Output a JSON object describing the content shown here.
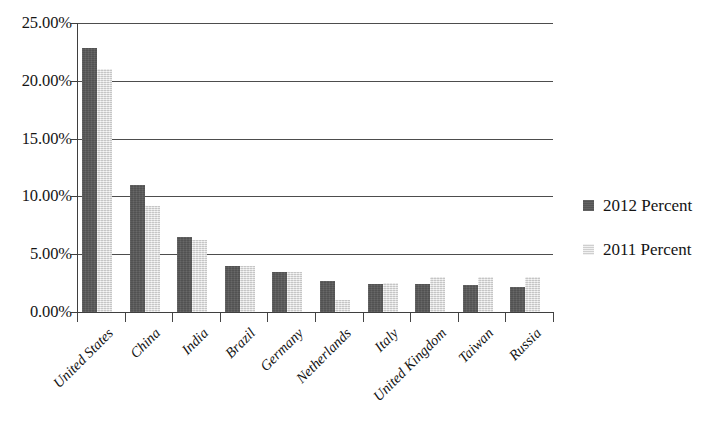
{
  "chart_data": {
    "type": "bar",
    "title": "",
    "subtitle": "",
    "xlabel": "",
    "ylabel": "",
    "ylim": [
      0,
      25
    ],
    "y_tick_labels": [
      "0.00%",
      "5.00%",
      "10.00%",
      "15.00%",
      "20.00%",
      "25.00%"
    ],
    "y_tick_values": [
      0,
      5,
      10,
      15,
      20,
      25
    ],
    "grid": true,
    "legend_position": "right",
    "categories": [
      "United States",
      "China",
      "India",
      "Brazil",
      "Germany",
      "Netherlands",
      "Italy",
      "United Kingdom",
      "Taiwan",
      "Russia"
    ],
    "series": [
      {
        "name": "2012 Percent",
        "color": "#595959",
        "values": [
          22.8,
          11.0,
          6.5,
          4.0,
          3.5,
          2.7,
          2.4,
          2.4,
          2.3,
          2.2
        ]
      },
      {
        "name": "2011 Percent",
        "color": "#e2e2e2",
        "values": [
          21.0,
          9.2,
          6.2,
          4.0,
          3.5,
          1.0,
          2.5,
          3.0,
          3.0,
          3.0
        ]
      }
    ]
  },
  "legend": {
    "items": [
      {
        "label": "2012 Percent"
      },
      {
        "label": "2011 Percent"
      }
    ]
  }
}
